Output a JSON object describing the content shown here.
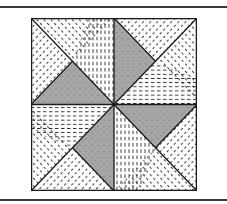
{
  "figure": {
    "colors": {
      "background": "#ffffff",
      "line": "#1a1a1a",
      "gray_fill": "#a6a6a6",
      "hatch": "#2a2a2a",
      "rule": "#3a3a3a"
    },
    "block": {
      "size": 166
    }
  }
}
